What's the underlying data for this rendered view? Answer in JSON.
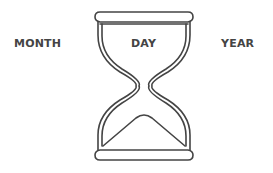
{
  "labels": {
    "month": "MONTH",
    "day": "DAY",
    "year": "YEAR"
  },
  "icon": "hourglass-icon",
  "colors": {
    "stroke": "#444444",
    "text": "#444444",
    "background": "#ffffff"
  }
}
